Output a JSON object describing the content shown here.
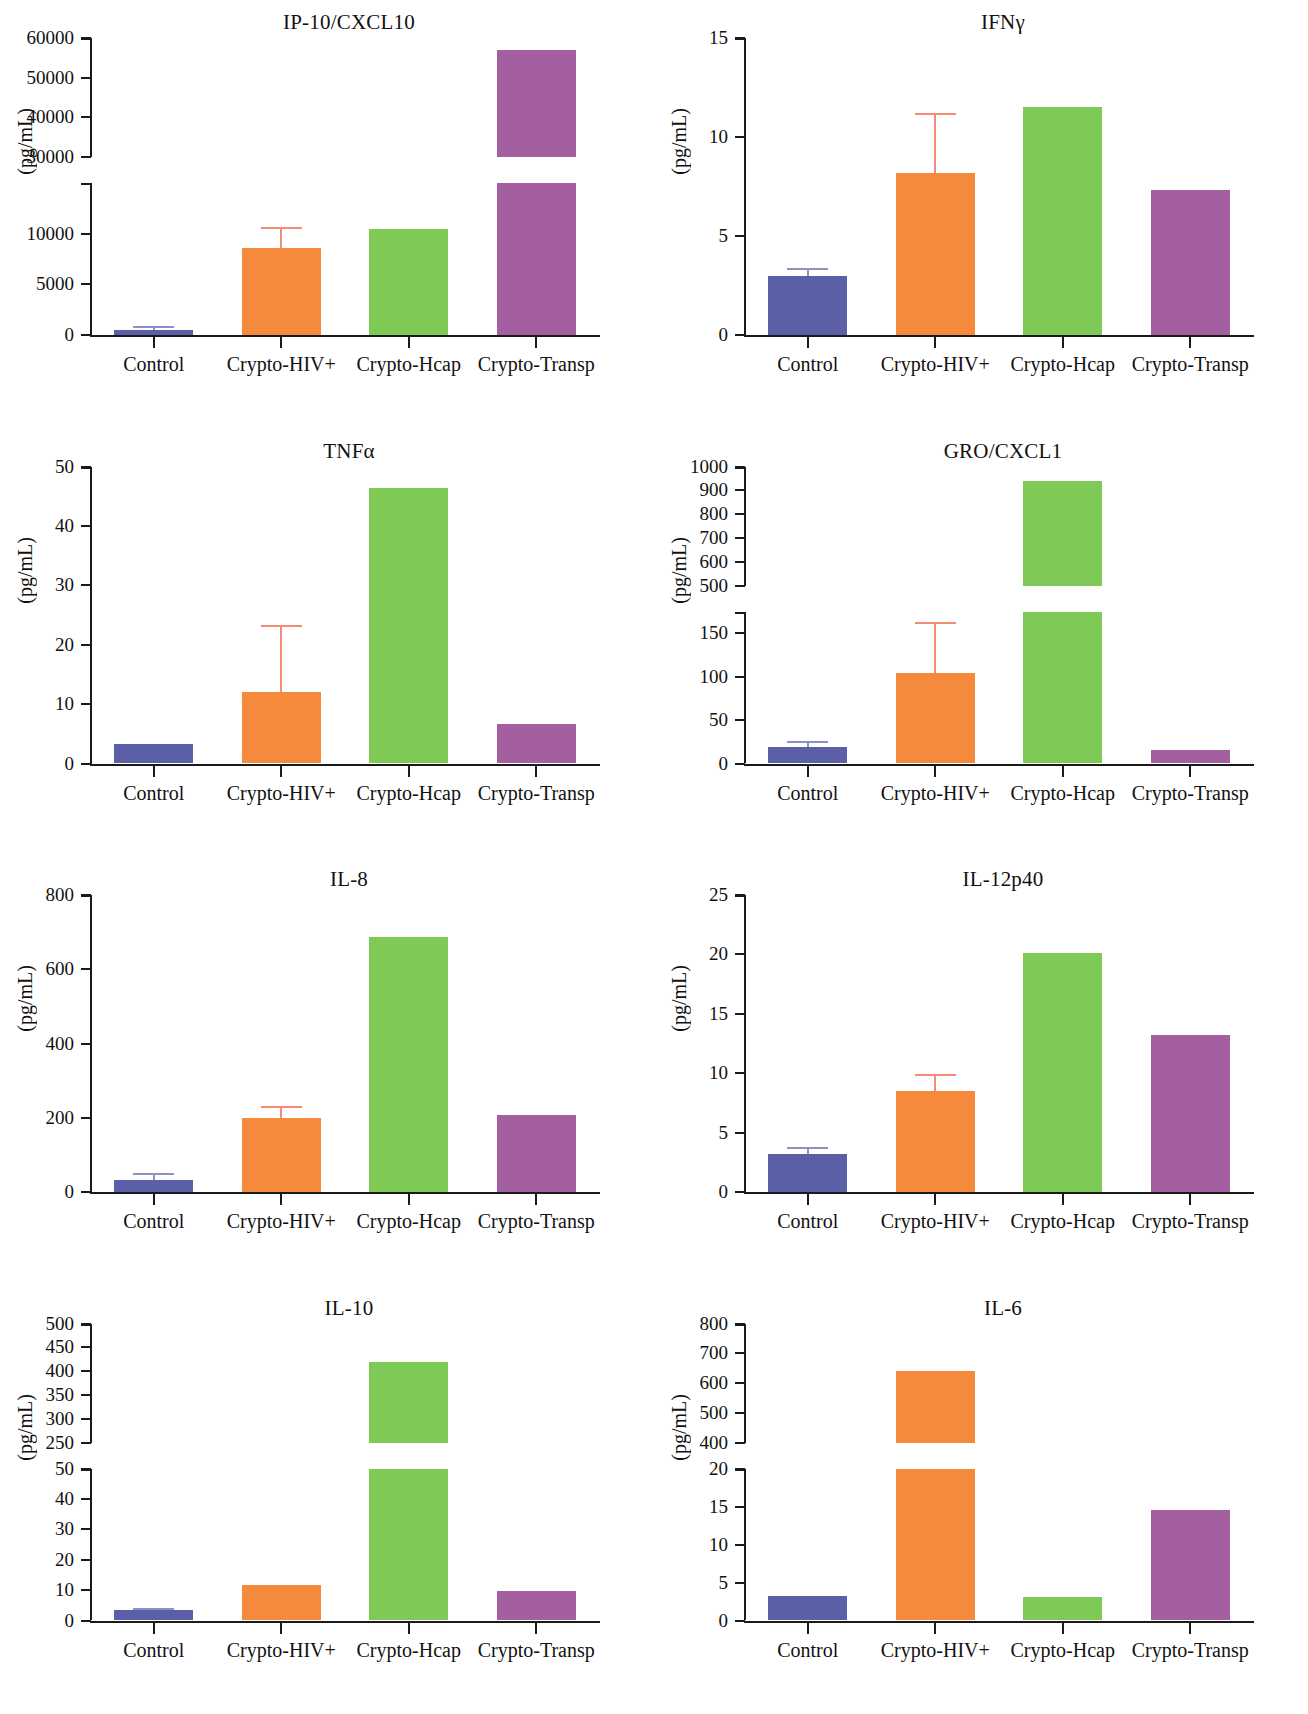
{
  "figure": {
    "ylabel": "(pg/mL)",
    "categories": [
      "Control",
      "Crypto-HIV+",
      "Crypto-Hcap",
      "Crypto-Transp"
    ],
    "colors": {
      "control": "#5B5FA8",
      "crypto_hiv": "#F58A3C",
      "crypto_hcap": "#7FC957",
      "crypto_transp": "#A45FA0",
      "error_orange": "#F48B72",
      "error_blue": "#8E8FC4",
      "axis": "#1a1a1a"
    }
  },
  "chart_data": [
    {
      "type": "bar",
      "title": "IP-10/CXCL10",
      "ylabel": "(pg/mL)",
      "xlabel": "",
      "categories": [
        "Control",
        "Crypto-HIV+",
        "Crypto-Hcap",
        "Crypto-Transp"
      ],
      "values": [
        450,
        8600,
        10500,
        57000
      ],
      "errors_upper": [
        900,
        10700,
        null,
        null
      ],
      "broken_axis": true,
      "lower_ticks": [
        0,
        5000,
        10000
      ],
      "lower_range": [
        0,
        15000
      ],
      "upper_ticks": [
        30000,
        40000,
        50000,
        60000
      ],
      "upper_range": [
        30000,
        60000
      ],
      "grid": false,
      "legend": "none"
    },
    {
      "type": "bar",
      "title": "IFNγ",
      "ylabel": "(pg/mL)",
      "xlabel": "",
      "categories": [
        "Control",
        "Crypto-HIV+",
        "Crypto-Hcap",
        "Crypto-Transp"
      ],
      "values": [
        3.0,
        8.2,
        11.5,
        7.3
      ],
      "errors_upper": [
        3.4,
        11.2,
        null,
        null
      ],
      "broken_axis": false,
      "ticks": [
        0,
        5,
        10,
        15
      ],
      "ylim": [
        0,
        15
      ],
      "grid": false,
      "legend": "none"
    },
    {
      "type": "bar",
      "title": "TNFα",
      "ylabel": "(pg/mL)",
      "xlabel": "",
      "categories": [
        "Control",
        "Crypto-HIV+",
        "Crypto-Hcap",
        "Crypto-Transp"
      ],
      "values": [
        3.2,
        12.1,
        46.3,
        6.7
      ],
      "errors_upper": [
        null,
        23.3,
        null,
        null
      ],
      "broken_axis": false,
      "ticks": [
        0,
        10,
        20,
        30,
        40,
        50
      ],
      "ylim": [
        0,
        50
      ],
      "grid": false,
      "legend": "none"
    },
    {
      "type": "bar",
      "title": "GRO/CXCL1",
      "ylabel": "(pg/mL)",
      "xlabel": "",
      "categories": [
        "Control",
        "Crypto-HIV+",
        "Crypto-Hcap",
        "Crypto-Transp"
      ],
      "values": [
        19,
        104,
        940,
        16
      ],
      "errors_upper": [
        26,
        163,
        null,
        null
      ],
      "broken_axis": true,
      "lower_ticks": [
        0,
        50,
        100,
        150
      ],
      "lower_range": [
        0,
        175
      ],
      "upper_ticks": [
        500,
        600,
        700,
        800,
        900,
        1000
      ],
      "upper_range": [
        500,
        1000
      ],
      "grid": false,
      "legend": "none"
    },
    {
      "type": "bar",
      "title": "IL-8",
      "ylabel": "(pg/mL)",
      "xlabel": "",
      "categories": [
        "Control",
        "Crypto-HIV+",
        "Crypto-Hcap",
        "Crypto-Transp"
      ],
      "values": [
        32,
        198,
        688,
        208
      ],
      "errors_upper": [
        52,
        232,
        null,
        null
      ],
      "broken_axis": false,
      "ticks": [
        0,
        200,
        400,
        600,
        800
      ],
      "ylim": [
        0,
        800
      ],
      "grid": false,
      "legend": "none"
    },
    {
      "type": "bar",
      "title": "IL-12p40",
      "ylabel": "(pg/mL)",
      "xlabel": "",
      "categories": [
        "Control",
        "Crypto-HIV+",
        "Crypto-Hcap",
        "Crypto-Transp"
      ],
      "values": [
        3.2,
        8.5,
        20.1,
        13.2
      ],
      "errors_upper": [
        3.8,
        9.9,
        null,
        null
      ],
      "broken_axis": false,
      "ticks": [
        0,
        5,
        10,
        15,
        20,
        25
      ],
      "ylim": [
        0,
        25
      ],
      "grid": false,
      "legend": "none"
    },
    {
      "type": "bar",
      "title": "IL-10",
      "ylabel": "(pg/mL)",
      "xlabel": "",
      "categories": [
        "Control",
        "Crypto-HIV+",
        "Crypto-Hcap",
        "Crypto-Transp"
      ],
      "values": [
        3.3,
        11.8,
        420,
        9.6
      ],
      "errors_upper": [
        4.2,
        null,
        null,
        null
      ],
      "broken_axis": true,
      "lower_ticks": [
        0,
        10,
        20,
        30,
        40,
        50
      ],
      "lower_range": [
        0,
        50
      ],
      "upper_ticks": [
        250,
        300,
        350,
        400,
        450,
        500
      ],
      "upper_range": [
        250,
        500
      ],
      "grid": false,
      "legend": "none"
    },
    {
      "type": "bar",
      "title": "IL-6",
      "ylabel": "(pg/mL)",
      "xlabel": "",
      "categories": [
        "Control",
        "Crypto-HIV+",
        "Crypto-Hcap",
        "Crypto-Transp"
      ],
      "values": [
        3.2,
        640,
        3.1,
        14.6
      ],
      "errors_upper": [
        null,
        null,
        null,
        null
      ],
      "broken_axis": true,
      "lower_ticks": [
        0,
        5,
        10,
        15,
        20
      ],
      "lower_range": [
        0,
        20
      ],
      "upper_ticks": [
        400,
        500,
        600,
        700,
        800
      ],
      "upper_range": [
        400,
        800
      ],
      "grid": false,
      "legend": "none"
    }
  ]
}
